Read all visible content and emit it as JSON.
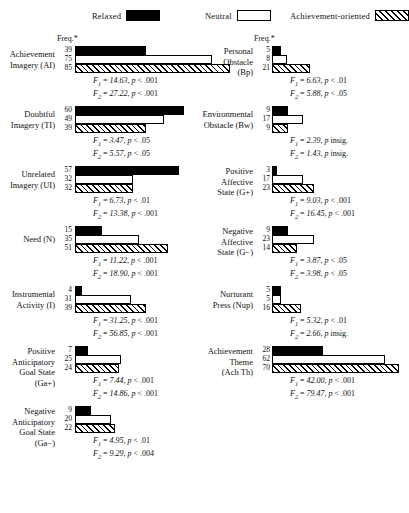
{
  "legend": {
    "items": [
      {
        "label": "Relaxed",
        "swatch": "solid-black",
        "color": "#000000"
      },
      {
        "label": "Neutral",
        "swatch": "open-white",
        "color": "#ffffff"
      },
      {
        "label": "Achievement-oriented",
        "swatch": "hatched",
        "color": "#000000"
      }
    ]
  },
  "axis": {
    "freq_header_left": "Freq.*",
    "freq_header_right": "Freq.*"
  },
  "chart_data": {
    "type": "bar",
    "orientation": "horizontal",
    "title": "",
    "xlabel": "Freq.*",
    "ylabel": "",
    "xlim": [
      0,
      90
    ],
    "grid": false,
    "legend_position": "top",
    "series": [
      {
        "name": "Relaxed",
        "style": "solid-black"
      },
      {
        "name": "Neutral",
        "style": "open-white"
      },
      {
        "name": "Achievement-oriented",
        "style": "hatched"
      }
    ],
    "categories": [
      "Achievement Imagery (AI)",
      "Doubtful Imagery (TI)",
      "Unrelated Imagery (UI)",
      "Need (N)",
      "Instrumental Activity (I)",
      "Positive Anticipatory Goal State (Ga+)",
      "Negative Anticipatory Goal State (Ga−)",
      "Personal Obstacle (Bp)",
      "Environmental Obstacle (Bw)",
      "Positive Affective State (G+)",
      "Negative Affective State (G−)",
      "Nurturant Press (Nup)",
      "Achievement Theme (Ach Th)"
    ],
    "values": {
      "Relaxed": [
        39,
        60,
        57,
        15,
        4,
        7,
        9,
        5,
        9,
        3,
        9,
        5,
        28
      ],
      "Neutral": [
        75,
        49,
        32,
        35,
        31,
        25,
        20,
        8,
        17,
        17,
        23,
        5,
        62
      ],
      "Achievement-oriented": [
        85,
        39,
        32,
        51,
        39,
        24,
        22,
        21,
        9,
        23,
        14,
        16,
        70
      ]
    }
  },
  "blocks": [
    {
      "id": "achievement-imagery",
      "name_lines": [
        "Achievement",
        "Imagery (AI)"
      ],
      "values": [
        39,
        75,
        85
      ],
      "stats": [
        {
          "stat": "F",
          "sub": "1",
          "value": "14.63",
          "p": "p < .001"
        },
        {
          "stat": "F",
          "sub": "2",
          "value": "27.22",
          "p": "p < .001"
        }
      ]
    },
    {
      "id": "doubtful-imagery",
      "name_lines": [
        "Doubtful",
        "Imagery (TI)"
      ],
      "values": [
        60,
        49,
        39
      ],
      "stats": [
        {
          "stat": "F",
          "sub": "1",
          "value": "3.47",
          "p": "p < .05"
        },
        {
          "stat": "F",
          "sub": "2",
          "value": "5.57",
          "p": "p < .05"
        }
      ]
    },
    {
      "id": "unrelated-imagery",
      "name_lines": [
        "Unrelated",
        "Imagery (UI)"
      ],
      "values": [
        57,
        32,
        32
      ],
      "stats": [
        {
          "stat": "F",
          "sub": "1",
          "value": "6.73",
          "p": "p < .01"
        },
        {
          "stat": "F",
          "sub": "2",
          "value": "13.38",
          "p": "p < .001"
        }
      ]
    },
    {
      "id": "need",
      "name_lines": [
        "Need (N)"
      ],
      "values": [
        15,
        35,
        51
      ],
      "stats": [
        {
          "stat": "F",
          "sub": "1",
          "value": "11.22",
          "p": "p < .001"
        },
        {
          "stat": "F",
          "sub": "2",
          "value": "18.90",
          "p": "p < .001"
        }
      ]
    },
    {
      "id": "instrumental-activity",
      "name_lines": [
        "Instrumental",
        "Activity (I)"
      ],
      "values": [
        4,
        31,
        39
      ],
      "stats": [
        {
          "stat": "F",
          "sub": "1",
          "value": "31.25",
          "p": "p < .001"
        },
        {
          "stat": "F",
          "sub": "2",
          "value": "56.85",
          "p": "p < .001"
        }
      ]
    },
    {
      "id": "positive-anticipatory-goal-state",
      "name_lines": [
        "Positive",
        "Anticipatory",
        "Goal State",
        "(Ga+)"
      ],
      "values": [
        7,
        25,
        24
      ],
      "stats": [
        {
          "stat": "F",
          "sub": "1",
          "value": "7.44",
          "p": "p < .001"
        },
        {
          "stat": "F",
          "sub": "2",
          "value": "14.86",
          "p": "p < .001"
        }
      ]
    },
    {
      "id": "negative-anticipatory-goal-state",
      "name_lines": [
        "Negative",
        "Anticipatory",
        "Goal State",
        "(Ga−)"
      ],
      "values": [
        9,
        20,
        22
      ],
      "stats": [
        {
          "stat": "F",
          "sub": "1",
          "value": "4.95",
          "p": "p < .01"
        },
        {
          "stat": "F",
          "sub": "2",
          "value": "9.29",
          "p": "p < .004"
        }
      ]
    },
    {
      "id": "personal-obstacle",
      "name_lines": [
        "Personal",
        "Obstacle",
        "(Bp)"
      ],
      "values": [
        5,
        8,
        21
      ],
      "stats": [
        {
          "stat": "F",
          "sub": "1",
          "value": "6.63",
          "p": "p < .01"
        },
        {
          "stat": "F",
          "sub": "2",
          "value": "5.88",
          "p": "p < .05"
        }
      ]
    },
    {
      "id": "environmental-obstacle",
      "name_lines": [
        "Environmental",
        "Obstacle (Bw)"
      ],
      "values": [
        9,
        17,
        9
      ],
      "stats": [
        {
          "stat": "F",
          "sub": "1",
          "value": "2.39",
          "p": "p insig."
        },
        {
          "stat": "F",
          "sub": "2",
          "value": "1.43",
          "p": "p insig."
        }
      ]
    },
    {
      "id": "positive-affective-state",
      "name_lines": [
        "Positive",
        "Affective",
        "State (G+)"
      ],
      "values": [
        3,
        17,
        23
      ],
      "stats": [
        {
          "stat": "F",
          "sub": "1",
          "value": "9.03",
          "p": "p < .001"
        },
        {
          "stat": "F",
          "sub": "2",
          "value": "16.45",
          "p": "p < .001"
        }
      ]
    },
    {
      "id": "negative-affective-state",
      "name_lines": [
        "Negative",
        "Affective",
        "State (G−)"
      ],
      "values": [
        9,
        23,
        14
      ],
      "stats": [
        {
          "stat": "F",
          "sub": "1",
          "value": "3.87",
          "p": "p < .05"
        },
        {
          "stat": "F",
          "sub": "2",
          "value": "3.98",
          "p": "p < .05"
        }
      ]
    },
    {
      "id": "nurturant-press",
      "name_lines": [
        "Nurturant",
        "Press (Nup)"
      ],
      "values": [
        5,
        5,
        16
      ],
      "stats": [
        {
          "stat": "F",
          "sub": "1",
          "value": "5.32",
          "p": "p < .01"
        },
        {
          "stat": "F",
          "sub": "2",
          "value": "2.66",
          "p": "p insig."
        }
      ]
    },
    {
      "id": "achievement-theme",
      "name_lines": [
        "Achievement",
        "Theme",
        "(Ach Th)"
      ],
      "values": [
        28,
        62,
        70
      ],
      "stats": [
        {
          "stat": "F",
          "sub": "1",
          "value": "42.00",
          "p": "p < .001"
        },
        {
          "stat": "F",
          "sub": "2",
          "value": "79.47",
          "p": "p < .001"
        }
      ]
    }
  ]
}
